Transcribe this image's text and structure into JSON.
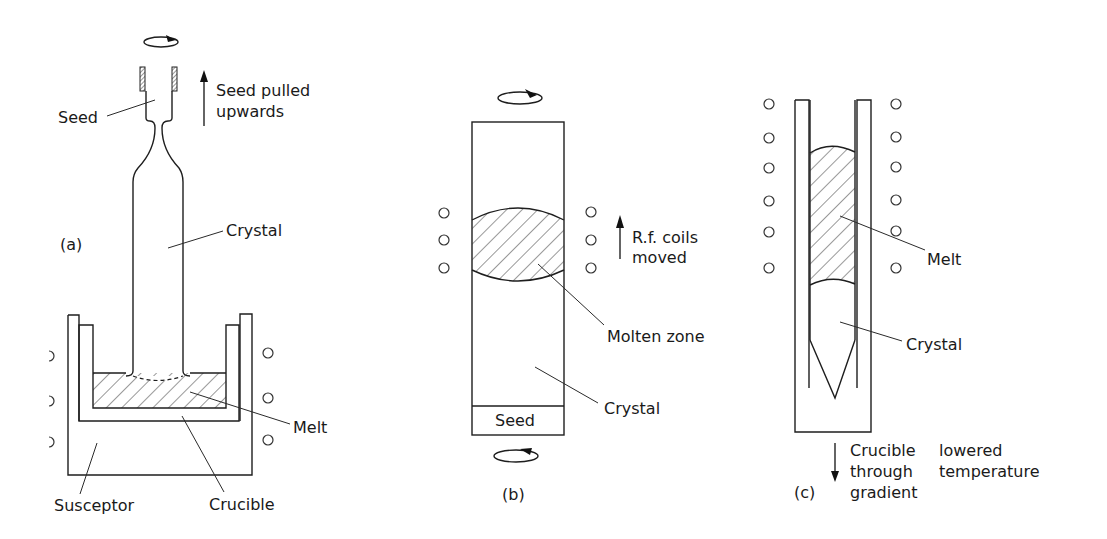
{
  "figure": {
    "panels": [
      {
        "id": "a",
        "caption": "(a)",
        "labels": {
          "seed": "Seed",
          "motion_line1": "Seed pulled",
          "motion_line2": "upwards",
          "crystal": "Crystal",
          "melt": "Melt",
          "susceptor": "Susceptor",
          "crucible": "Crucible"
        },
        "icons": [
          "rotation-arrow-icon",
          "up-arrow-icon"
        ]
      },
      {
        "id": "b",
        "caption": "(b)",
        "labels": {
          "motion_line1": "R.f. coils",
          "motion_line2": "moved",
          "molten_zone": "Molten zone",
          "crystal": "Crystal",
          "seed": "Seed"
        },
        "icons": [
          "rotation-arrow-icon",
          "rotation-arrow-icon",
          "up-arrow-icon"
        ]
      },
      {
        "id": "c",
        "caption": "(c)",
        "labels": {
          "melt": "Melt",
          "crystal": "Crystal",
          "motion_line1_a": "Crucible",
          "motion_line1_b": "lowered",
          "motion_line2_a": "through",
          "motion_line2_b": "temperature",
          "motion_line3": "gradient"
        },
        "icons": [
          "down-arrow-icon"
        ]
      }
    ],
    "colors": {
      "line": "#1e1e1e",
      "background": "#ffffff"
    }
  }
}
